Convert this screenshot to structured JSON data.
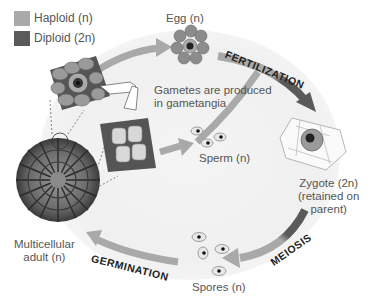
{
  "legend": {
    "items": [
      {
        "label": "Haploid (n)",
        "color": "#a9a9a9"
      },
      {
        "label": "Diploid (2n)",
        "color": "#5a5a5a"
      }
    ]
  },
  "labels": {
    "egg": "Egg (n)",
    "gametes_note_line1": "Gametes are produced",
    "gametes_note_line2": "in gametangia",
    "sperm": "Sperm (n)",
    "zygote_line1": "Zygote (2n)",
    "zygote_line2": "(retained on",
    "zygote_line3": "parent)",
    "spores": "Spores (n)",
    "adult_line1": "Multicellular",
    "adult_line2": "adult (n)"
  },
  "stages": {
    "fertilization": "FERTILIZATION",
    "meiosis": "MEIOSIS",
    "germination": "GERMINATION"
  },
  "colors": {
    "haploid_arrow": "#a9a9a9",
    "diploid_arrow": "#5a5a5a",
    "text": "#555555",
    "stage_text": "#222222"
  }
}
